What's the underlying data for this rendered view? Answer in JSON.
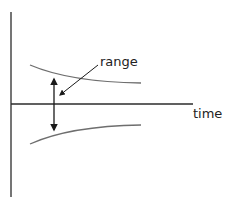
{
  "diagram": {
    "labels": {
      "range": "range",
      "time": "time"
    },
    "colors": {
      "axis": "#2b2b2b",
      "curve": "#6e6e6e",
      "arrow": "#1a1a1a",
      "background": "#ffffff"
    }
  }
}
